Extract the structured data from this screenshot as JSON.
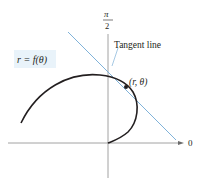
{
  "diagram": {
    "curve_label": "r = f(θ)",
    "tangent_label": "Tangent line",
    "point_label": "(r, θ)",
    "axis_top_label_num": "π",
    "axis_top_label_den": "2",
    "axis_right_label": "0",
    "colors": {
      "curve": "#231f20",
      "tangent": "#7fb2d9",
      "axis": "#8a8a8a",
      "label_box": "#e6f2fa"
    }
  }
}
